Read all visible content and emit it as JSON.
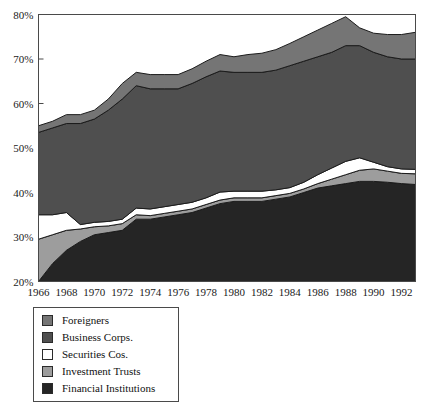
{
  "chart_data": {
    "type": "area",
    "title": "",
    "subtitle": "",
    "xlabel": "",
    "ylabel": "",
    "stacked": true,
    "percent_axis": true,
    "grid": false,
    "xlim": [
      1966,
      1993
    ],
    "ylim": [
      20,
      80
    ],
    "y_ticks": [
      20,
      30,
      40,
      50,
      60,
      70,
      80
    ],
    "y_tick_labels": [
      "20%",
      "30%",
      "40%",
      "50%",
      "60%",
      "70%",
      "80%"
    ],
    "x_ticks": [
      1966,
      1968,
      1970,
      1972,
      1974,
      1976,
      1978,
      1980,
      1982,
      1984,
      1986,
      1988,
      1990,
      1992
    ],
    "x_tick_labels": [
      "1966",
      "1968",
      "1970",
      "1972",
      "1974",
      "1976",
      "1978",
      "1980",
      "1982",
      "1984",
      "1986",
      "1988",
      "1990",
      "1992"
    ],
    "x": [
      1966,
      1967,
      1968,
      1969,
      1970,
      1971,
      1972,
      1973,
      1974,
      1975,
      1976,
      1977,
      1978,
      1979,
      1980,
      1981,
      1982,
      1983,
      1984,
      1985,
      1986,
      1987,
      1988,
      1989,
      1990,
      1991,
      1992,
      1993
    ],
    "legend_position": "below-left",
    "series": [
      {
        "name": "Financial Institutions",
        "color": "#252525",
        "values": [
          20.0,
          24.0,
          27.0,
          29.0,
          30.5,
          31.0,
          31.5,
          34.0,
          34.0,
          34.5,
          35.0,
          35.5,
          36.5,
          37.5,
          38.0,
          38.0,
          38.0,
          38.5,
          39.0,
          40.0,
          41.0,
          41.5,
          42.0,
          42.5,
          42.5,
          42.3,
          42.0,
          41.8
        ]
      },
      {
        "name": "Investment Trusts",
        "color": "#9d9d9d",
        "values": [
          9.5,
          6.5,
          4.5,
          2.8,
          1.8,
          1.5,
          1.5,
          1.0,
          0.8,
          0.8,
          0.8,
          0.8,
          0.8,
          0.8,
          0.8,
          0.8,
          0.8,
          0.8,
          0.8,
          0.8,
          1.0,
          1.5,
          2.0,
          2.5,
          2.8,
          2.5,
          2.3,
          2.4
        ]
      },
      {
        "name": "Securities Cos.",
        "color": "#ffffff",
        "values": [
          5.5,
          4.5,
          4.0,
          1.0,
          1.0,
          1.0,
          1.0,
          1.5,
          1.5,
          1.5,
          1.5,
          1.5,
          1.5,
          1.8,
          1.5,
          1.5,
          1.5,
          1.3,
          1.3,
          1.5,
          2.0,
          2.5,
          3.0,
          2.8,
          1.5,
          1.0,
          1.0,
          1.0
        ]
      },
      {
        "name": "Business Corps.",
        "color": "#4f4f4f",
        "values": [
          18.5,
          19.5,
          20.0,
          22.7,
          23.2,
          25.0,
          27.0,
          27.5,
          27.0,
          26.5,
          26.0,
          26.7,
          27.2,
          27.2,
          26.7,
          26.7,
          26.7,
          26.9,
          27.4,
          27.2,
          26.5,
          26.0,
          26.0,
          25.2,
          24.7,
          24.7,
          24.7,
          24.8
        ]
      },
      {
        "name": "Foreigners",
        "color": "#757575",
        "values": [
          1.5,
          1.5,
          2.0,
          2.0,
          2.0,
          2.5,
          3.5,
          3.0,
          3.2,
          3.2,
          3.2,
          3.3,
          3.5,
          3.7,
          3.5,
          4.0,
          4.3,
          4.6,
          5.0,
          5.5,
          6.0,
          6.5,
          6.5,
          4.0,
          4.3,
          5.0,
          5.5,
          6.0
        ]
      }
    ]
  },
  "axis": {
    "y_labels": [
      "80%",
      "70%",
      "60%",
      "50%",
      "40%",
      "30%",
      "20%"
    ],
    "x_labels": [
      "1966",
      "1968",
      "1970",
      "1972",
      "1974",
      "1976",
      "1978",
      "1980",
      "1982",
      "1984",
      "1986",
      "1988",
      "1990",
      "1992"
    ]
  },
  "legend": {
    "items": [
      {
        "label": "Foreigners",
        "color": "#757575"
      },
      {
        "label": "Business Corps.",
        "color": "#4f4f4f"
      },
      {
        "label": "Securities Cos.",
        "color": "#ffffff"
      },
      {
        "label": "Investment Trusts",
        "color": "#9d9d9d"
      },
      {
        "label": "Financial Institutions",
        "color": "#252525"
      }
    ]
  }
}
